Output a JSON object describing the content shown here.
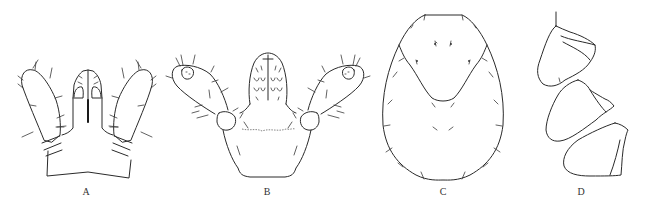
{
  "figure": {
    "panels": [
      {
        "id": "A",
        "label": "A",
        "description": "gnathosoma with palps, dorsal view",
        "label_x": 86,
        "label_y": 185
      },
      {
        "id": "B",
        "label": "B",
        "description": "gnathosoma with palps and hypostome, ventral view",
        "label_x": 267,
        "label_y": 185
      },
      {
        "id": "C",
        "label": "C",
        "description": "idiosoma / scutum outline with setae",
        "label_x": 443,
        "label_y": 185
      },
      {
        "id": "D",
        "label": "D",
        "description": "coxae",
        "label_x": 581,
        "label_y": 185
      }
    ],
    "colors": {
      "background": "#ffffff",
      "line": "#2a2a2a",
      "label": "#333333"
    }
  }
}
